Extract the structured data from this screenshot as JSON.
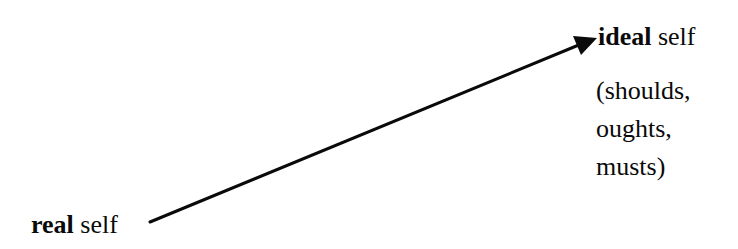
{
  "diagram": {
    "background_color": "#ffffff",
    "stroke_color": "#0a0a0a",
    "text_color": "#0a0a0a",
    "source_label": {
      "emphasis_word": "real",
      "plain_word": "self"
    },
    "target_label": {
      "emphasis_word": "ideal",
      "plain_word": "self"
    },
    "attributes": [
      "(shoulds,",
      "oughts,",
      "musts)"
    ],
    "arrow": {
      "start_x": 150,
      "start_y": 222,
      "end_x": 597,
      "end_y": 38,
      "stroke_width": 3,
      "head_length": 22,
      "head_width": 17
    }
  }
}
